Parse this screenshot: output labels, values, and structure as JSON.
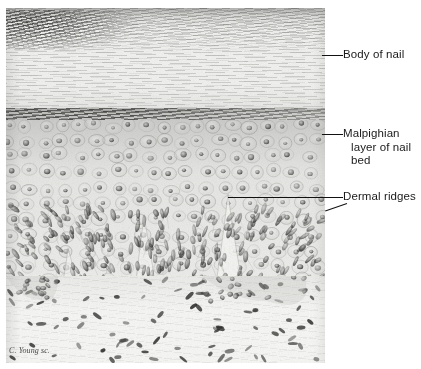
{
  "figure": {
    "type": "histological-micrograph",
    "signature": "C. Young sc."
  },
  "annotations": [
    {
      "id": "body-of-nail",
      "lines": [
        "Body of nail"
      ],
      "leader": "horizontal"
    },
    {
      "id": "malpighian",
      "lines": [
        "Malpighian",
        "layer of nail",
        "bed"
      ],
      "leader": "horizontal"
    },
    {
      "id": "dermal-ridges",
      "lines": [
        "Dermal ridges"
      ],
      "leader": "horizontal-long-plus-diagonal-tick"
    }
  ],
  "layers": [
    {
      "id": "nail-body",
      "name": "Body of nail",
      "description": "Laminated keratin plate with wavy fibrous striations; dense dark wedge at upper left"
    },
    {
      "id": "junction",
      "name": "Nail-to-bed junction",
      "description": "Dark band of flattened, deeply stained cells"
    },
    {
      "id": "malpighian",
      "name": "Malpighian layer of nail bed",
      "description": "Polygonal epidermal cells with round nuclei"
    },
    {
      "id": "dermis",
      "name": "Dermis",
      "description": "Loose connective tissue with scattered elongated fibroblast nuclei"
    }
  ],
  "colors": {
    "page_background": "#ffffff",
    "plate_base": "#eeeeec",
    "label_text": "#1a1a1a",
    "leader_line": "#111111",
    "nucleus_dark": "#2b2b29"
  }
}
